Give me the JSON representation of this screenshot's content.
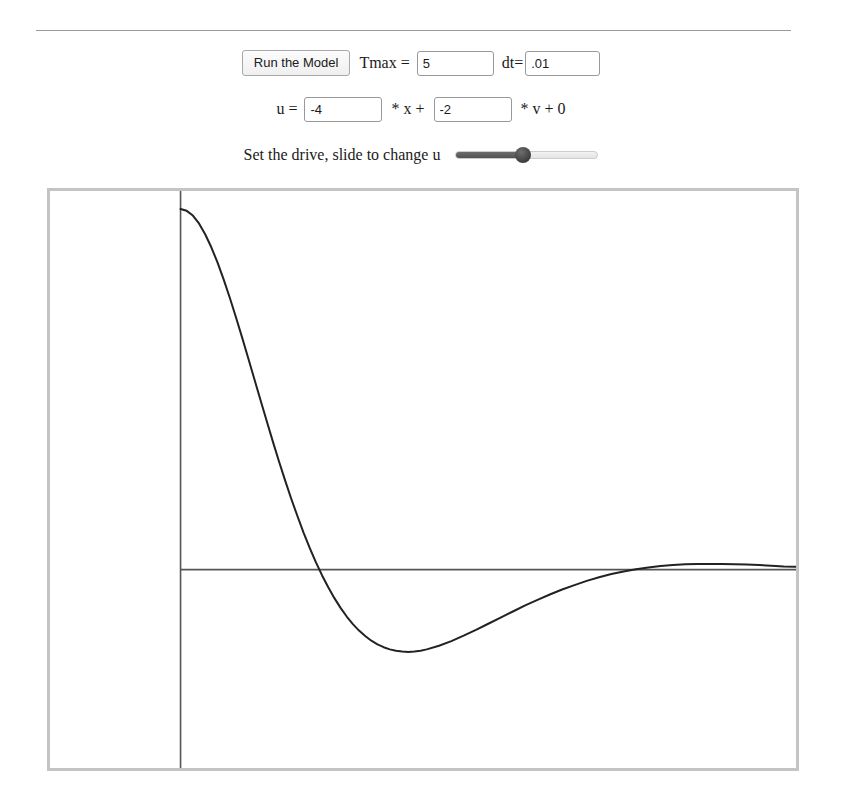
{
  "divider": {
    "name": "horizontal-rule"
  },
  "controls": {
    "run_button_label": "Run the Model",
    "tmax_label": "Tmax =",
    "tmax_value": "5",
    "dt_label": "dt=",
    "dt_value": ".01",
    "equation": {
      "u_label": "u =",
      "gain_x_value": "-4",
      "times_x": "* x +",
      "gain_v_value": "-2",
      "tail": "* v + 0"
    },
    "drive_label": "Set the drive, slide to change u",
    "slider": {
      "min": 0,
      "max": 100,
      "value": 47
    }
  },
  "chart_data": {
    "type": "line",
    "title": "",
    "xlabel": "",
    "ylabel": "",
    "xlim": [
      0,
      5
    ],
    "ylim": [
      -0.55,
      1.05
    ],
    "grid": false,
    "legend": null,
    "axes": {
      "x_axis_y_value": 0,
      "y_axis_x_value": 0,
      "axis_color": "#555555"
    },
    "series": [
      {
        "name": "x(t)",
        "color": "#222222",
        "line_width": 2,
        "points": [
          [
            0.0,
            1.0
          ],
          [
            0.05,
            0.995
          ],
          [
            0.1,
            0.982
          ],
          [
            0.15,
            0.96
          ],
          [
            0.2,
            0.93
          ],
          [
            0.25,
            0.894
          ],
          [
            0.3,
            0.852
          ],
          [
            0.35,
            0.805
          ],
          [
            0.4,
            0.754
          ],
          [
            0.45,
            0.7
          ],
          [
            0.5,
            0.644
          ],
          [
            0.55,
            0.586
          ],
          [
            0.6,
            0.528
          ],
          [
            0.65,
            0.47
          ],
          [
            0.7,
            0.412
          ],
          [
            0.75,
            0.355
          ],
          [
            0.8,
            0.3
          ],
          [
            0.85,
            0.247
          ],
          [
            0.9,
            0.196
          ],
          [
            0.95,
            0.148
          ],
          [
            1.0,
            0.102
          ],
          [
            1.05,
            0.06
          ],
          [
            1.1,
            0.02
          ],
          [
            1.15,
            -0.016
          ],
          [
            1.2,
            -0.049
          ],
          [
            1.25,
            -0.079
          ],
          [
            1.3,
            -0.106
          ],
          [
            1.35,
            -0.13
          ],
          [
            1.4,
            -0.151
          ],
          [
            1.45,
            -0.169
          ],
          [
            1.5,
            -0.184
          ],
          [
            1.55,
            -0.197
          ],
          [
            1.6,
            -0.207
          ],
          [
            1.65,
            -0.215
          ],
          [
            1.7,
            -0.221
          ],
          [
            1.75,
            -0.225
          ],
          [
            1.8,
            -0.227
          ],
          [
            1.85,
            -0.228
          ],
          [
            1.9,
            -0.227
          ],
          [
            1.95,
            -0.225
          ],
          [
            2.0,
            -0.221
          ],
          [
            2.1,
            -0.211
          ],
          [
            2.2,
            -0.198
          ],
          [
            2.3,
            -0.183
          ],
          [
            2.4,
            -0.167
          ],
          [
            2.5,
            -0.15
          ],
          [
            2.6,
            -0.133
          ],
          [
            2.7,
            -0.116
          ],
          [
            2.8,
            -0.099
          ],
          [
            2.9,
            -0.084
          ],
          [
            3.0,
            -0.069
          ],
          [
            3.1,
            -0.055
          ],
          [
            3.2,
            -0.043
          ],
          [
            3.3,
            -0.031
          ],
          [
            3.4,
            -0.021
          ],
          [
            3.5,
            -0.012
          ],
          [
            3.6,
            -0.005
          ],
          [
            3.7,
            0.001
          ],
          [
            3.8,
            0.006
          ],
          [
            3.9,
            0.01
          ],
          [
            4.0,
            0.013
          ],
          [
            4.1,
            0.015
          ],
          [
            4.2,
            0.016
          ],
          [
            4.3,
            0.016
          ],
          [
            4.4,
            0.016
          ],
          [
            4.5,
            0.015
          ],
          [
            4.6,
            0.014
          ],
          [
            4.7,
            0.013
          ],
          [
            4.8,
            0.011
          ],
          [
            4.9,
            0.009
          ],
          [
            5.0,
            0.008
          ],
          [
            5.2,
            0.005
          ],
          [
            5.4,
            0.003
          ],
          [
            5.6,
            0.002
          ],
          [
            5.8,
            0.001
          ],
          [
            6.0,
            0.0
          ],
          [
            6.5,
            0.0
          ],
          [
            7.0,
            0.0
          ]
        ]
      }
    ]
  }
}
